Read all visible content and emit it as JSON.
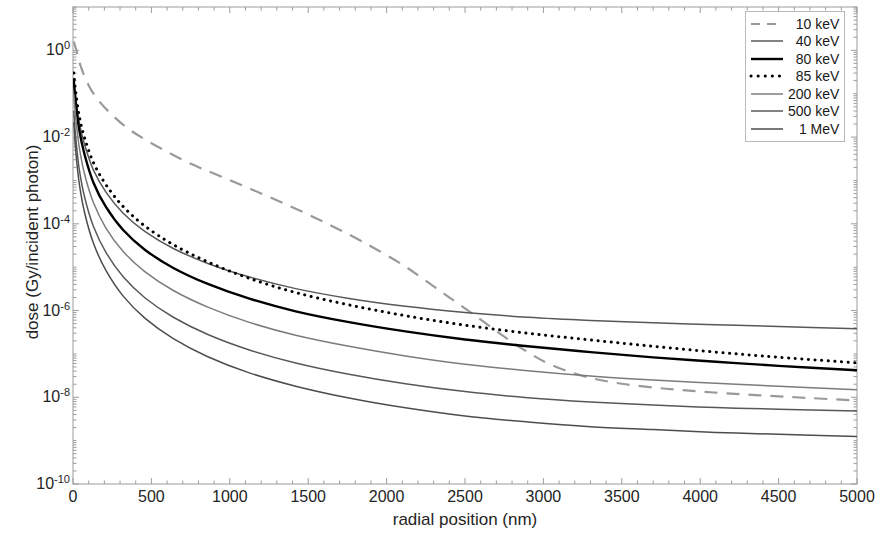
{
  "chart_data": {
    "type": "line",
    "title": "",
    "xlabel": "radial position (nm)",
    "ylabel": "dose (Gy/incident photon)",
    "xlim": [
      0,
      5000
    ],
    "ylim": [
      1e-10,
      10.0
    ],
    "yscale": "log",
    "xscale": "linear",
    "grid": false,
    "legend_position": "top-right",
    "xticks": [
      0,
      500,
      1000,
      1500,
      2000,
      2500,
      3000,
      3500,
      4000,
      4500,
      5000
    ],
    "xtick_labels": [
      "0",
      "500",
      "1000",
      "1500",
      "2000",
      "2500",
      "3000",
      "3500",
      "4000",
      "4500",
      "5000"
    ],
    "yticks": [
      1,
      0.01,
      0.0001,
      1e-06,
      1e-08,
      1e-10
    ],
    "ytick_labels": [
      "10⁰",
      "10⁻²",
      "10⁻⁴",
      "10⁻⁶",
      "10⁻⁸",
      "10⁻¹⁰"
    ],
    "ytick_mantissa": "10",
    "ytick_exponents": [
      "0",
      "-2",
      "-4",
      "-6",
      "-8",
      "-10"
    ],
    "series": [
      {
        "name": "10 keV",
        "label": "10 keV",
        "color": "#9a9a9a",
        "style": "dashed",
        "width": 2.2,
        "x": [
          5,
          20,
          50,
          100,
          160,
          240,
          340,
          460,
          600,
          760,
          940,
          1140,
          1360,
          1600,
          1850,
          2100,
          2300,
          2450,
          2600,
          2750,
          2900,
          3050,
          3250,
          3500,
          3800,
          4100,
          4400,
          4700,
          5000
        ],
        "y": [
          1.6,
          1.05,
          0.42,
          0.155,
          0.072,
          0.035,
          0.0168,
          0.0088,
          0.0046,
          0.00235,
          0.00125,
          0.00062,
          0.00028,
          0.00011,
          3.8e-05,
          1.15e-05,
          3.6e-06,
          1.5e-06,
          6.2e-07,
          2.5e-07,
          1.1e-07,
          5.6e-08,
          3.1e-08,
          2.05e-08,
          1.55e-08,
          1.28e-08,
          1.1e-08,
          9.6e-09,
          8.4e-09
        ]
      },
      {
        "name": "40 keV",
        "label": "40 keV",
        "color": "#585858",
        "style": "solid",
        "width": 1.5,
        "x": [
          5,
          18,
          40,
          75,
          130,
          210,
          320,
          460,
          640,
          860,
          1120,
          1420,
          1760,
          2120,
          2500,
          2900,
          3300,
          3700,
          4100,
          4500,
          5000
        ],
        "y": [
          0.23,
          0.075,
          0.021,
          0.0065,
          0.00175,
          0.00054,
          0.000175,
          6.6e-05,
          2.7e-05,
          1.22e-05,
          6e-06,
          3.2e-06,
          1.9e-06,
          1.25e-06,
          9e-07,
          7e-07,
          5.9e-07,
          5.2e-07,
          4.7e-07,
          4.3e-07,
          3.8e-07
        ]
      },
      {
        "name": "80 keV",
        "label": "80 keV",
        "color": "#000000",
        "style": "solid",
        "width": 2.4,
        "x": [
          5,
          18,
          40,
          75,
          130,
          210,
          320,
          460,
          640,
          860,
          1120,
          1420,
          1760,
          2120,
          2500,
          2900,
          3300,
          3700,
          4100,
          4500,
          5000
        ],
        "y": [
          0.2,
          0.06,
          0.0145,
          0.0038,
          0.0009,
          0.000245,
          7.2e-05,
          2.5e-05,
          9.6e-06,
          4.1e-06,
          1.9e-06,
          9.6e-07,
          5.4e-07,
          3.3e-07,
          2.15e-07,
          1.5e-07,
          1.1e-07,
          8.3e-08,
          6.6e-08,
          5.3e-08,
          4.2e-08
        ]
      },
      {
        "name": "85 keV",
        "label": "85 keV",
        "color": "#000000",
        "style": "dotted",
        "width": 3.0,
        "x": [
          5,
          18,
          40,
          75,
          130,
          210,
          320,
          460,
          640,
          860,
          1120,
          1420,
          1760,
          2120,
          2500,
          2900,
          3300,
          3700,
          4100,
          4500,
          5000
        ],
        "y": [
          0.3,
          0.105,
          0.03,
          0.0093,
          0.0026,
          0.0008,
          0.00025,
          8.8e-05,
          3.3e-05,
          1.32e-05,
          5.6e-06,
          2.6e-06,
          1.35e-06,
          7.6e-07,
          4.6e-07,
          3e-07,
          2.1e-07,
          1.5e-07,
          1.1e-07,
          8.4e-08,
          6.2e-08
        ]
      },
      {
        "name": "200 keV",
        "label": "200 keV",
        "color": "#7c7c7c",
        "style": "solid",
        "width": 1.5,
        "x": [
          5,
          18,
          40,
          75,
          130,
          210,
          320,
          460,
          640,
          860,
          1120,
          1420,
          1760,
          2120,
          2500,
          2900,
          3300,
          3700,
          4100,
          4500,
          5000
        ],
        "y": [
          0.1,
          0.027,
          0.0058,
          0.00135,
          0.00031,
          8e-05,
          2.3e-05,
          7.8e-06,
          2.9e-06,
          1.2e-06,
          5.4e-07,
          2.7e-07,
          1.5e-07,
          9e-08,
          5.8e-08,
          4.1e-08,
          3.1e-08,
          2.5e-08,
          2.1e-08,
          1.8e-08,
          1.5e-08
        ]
      },
      {
        "name": "500 keV",
        "label": "500 keV",
        "color": "#585858",
        "style": "solid",
        "width": 1.5,
        "x": [
          5,
          18,
          40,
          75,
          130,
          210,
          320,
          460,
          640,
          860,
          1120,
          1420,
          1760,
          2120,
          2500,
          2900,
          3300,
          3700,
          4100,
          4500,
          5000
        ],
        "y": [
          0.04,
          0.0092,
          0.0018,
          0.0004,
          8.8e-05,
          2.2e-05,
          6e-06,
          1.95e-06,
          7e-07,
          2.8e-07,
          1.25e-07,
          6.2e-08,
          3.4e-08,
          2.05e-08,
          1.35e-08,
          9.8e-09,
          7.8e-09,
          6.6e-09,
          5.8e-09,
          5.3e-09,
          4.8e-09
        ]
      },
      {
        "name": "1 MeV",
        "label": "1 MeV",
        "color": "#4d4d4d",
        "style": "solid",
        "width": 1.5,
        "x": [
          5,
          18,
          40,
          75,
          130,
          210,
          320,
          460,
          640,
          860,
          1120,
          1420,
          1760,
          2120,
          2500,
          2900,
          3300,
          3700,
          4100,
          4500,
          5000
        ],
        "y": [
          0.022,
          0.0046,
          0.00085,
          0.000175,
          3.6e-05,
          8.4e-06,
          2.15e-06,
          6.6e-07,
          2.25e-07,
          8.6e-08,
          3.7e-08,
          1.8e-08,
          9.6e-09,
          5.7e-09,
          3.7e-09,
          2.7e-09,
          2.1e-09,
          1.8e-09,
          1.55e-09,
          1.4e-09,
          1.25e-09
        ]
      }
    ]
  },
  "plot": {
    "frame_color": "#9c9c9c",
    "background": "#ffffff"
  }
}
